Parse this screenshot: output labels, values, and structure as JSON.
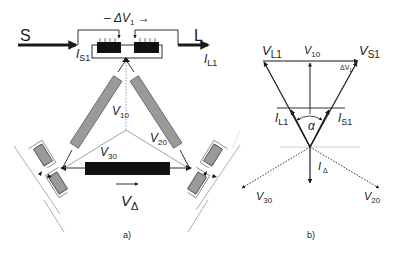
{
  "figure": {
    "panel_a": {
      "caption": "a)",
      "source_label": "S",
      "load_label": "L",
      "source_current": {
        "main": "I",
        "sub": "S1"
      },
      "load_current": {
        "main": "I",
        "sub": "L1"
      },
      "series_voltage": {
        "prefix": "– ",
        "main": "ΔV",
        "sub": "1",
        "suffix": " →"
      },
      "v10": {
        "main": "V",
        "sub": "10"
      },
      "v20": {
        "main": "V",
        "sub": "20"
      },
      "v30": {
        "main": "V",
        "sub": "30"
      },
      "v_delta": {
        "main": "V",
        "sub": "Δ"
      }
    },
    "panel_b": {
      "caption": "b)",
      "vl1": {
        "main": "V",
        "sub": "L1"
      },
      "vs1": {
        "main": "V",
        "sub": "S1"
      },
      "v10": {
        "main": "V",
        "sub": "10"
      },
      "dv1": {
        "main": "ΔV",
        "sub": "1"
      },
      "il1": {
        "main": "I",
        "sub": "L1"
      },
      "is1": {
        "main": "I",
        "sub": "S1"
      },
      "alpha": "α",
      "i_delta": {
        "main": "I",
        "sub": "Δ"
      },
      "v30": {
        "main": "V",
        "sub": "30"
      },
      "v20": {
        "main": "V",
        "sub": "20"
      }
    },
    "colors": {
      "line": "#1a1a1a",
      "gray_winding": "#9a9a9a",
      "black_winding": "#111111",
      "thin": "#777777",
      "horizon": "#c8c8b8"
    }
  }
}
